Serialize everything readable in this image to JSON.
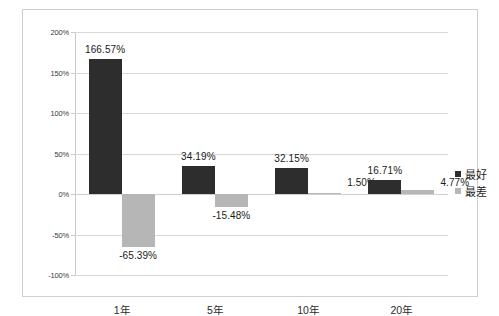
{
  "chart_data": {
    "type": "bar",
    "title": "",
    "subtitle": "",
    "xlabel": "",
    "ylabel": "",
    "categories": [
      "1年",
      "5年",
      "10年",
      "20年"
    ],
    "series": [
      {
        "name": "最好",
        "color": "#2d2d2d",
        "values": [
          166.57,
          34.19,
          32.15,
          16.71
        ],
        "labels": [
          "166.57%",
          "34.19%",
          "32.15%",
          "16.71%"
        ]
      },
      {
        "name": "最差",
        "color": "#b6b6b6",
        "values": [
          -65.39,
          -15.48,
          1.5,
          4.77
        ],
        "labels": [
          "-65.39%",
          "-15.48%",
          "1.50%",
          "4.77%"
        ]
      }
    ],
    "ylim": [
      -100,
      200
    ],
    "yticks": [
      200,
      150,
      100,
      50,
      0,
      -50,
      -100
    ],
    "ytick_labels": [
      "200%",
      "150%",
      "100%",
      "50%",
      "0%",
      "-50%",
      "-100%"
    ],
    "grid": true,
    "legend_position": "right",
    "value_unit": "%"
  },
  "legend": {
    "items": [
      {
        "label": "最好",
        "swatch": "best"
      },
      {
        "label": "最差",
        "swatch": "worst"
      }
    ]
  }
}
